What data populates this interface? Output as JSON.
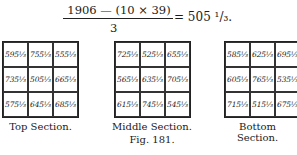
{
  "formula": {
    "numerator": "1906 — (10 × 39)",
    "denominator": "3",
    "result": "= 505 ¹/₃."
  },
  "sections": [
    {
      "label": "Top Section.",
      "cells": [
        "595⅓",
        "755⅓",
        "555⅓",
        "735⅓",
        "505⅓",
        "665⅓",
        "575⅓",
        "645⅓",
        "685⅓"
      ]
    },
    {
      "label": "Middle Section.",
      "cells": [
        "725⅓",
        "525⅓",
        "655⅓",
        "565⅓",
        "635⅓",
        "705⅓",
        "615⅓",
        "745⅓",
        "545⅓"
      ]
    },
    {
      "label": "Bottom Section.",
      "cells": [
        "585⅓",
        "625⅓",
        "695⅓",
        "605⅓",
        "765⅓",
        "535⅓",
        "715⅓",
        "515⅓",
        "675⅓"
      ]
    }
  ],
  "caption": "Fig. 181."
}
